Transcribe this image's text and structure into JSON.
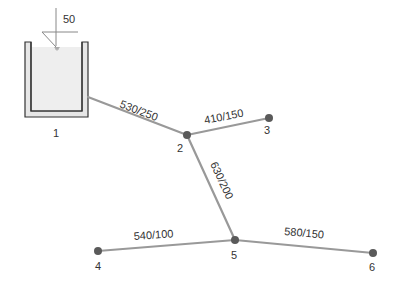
{
  "diagram": {
    "type": "pipe-network",
    "colors": {
      "pipe": "#999999",
      "node": "#5a5a5a",
      "tank_wall": "#333333",
      "tank_fill": "#e8e8e8",
      "tank_water": "#eeeeee",
      "text": "#333333"
    },
    "tank": {
      "id": "1",
      "label": "1",
      "head_value": "50"
    },
    "nodes": [
      {
        "id": "1",
        "label": "1",
        "x": 56,
        "y": 130
      },
      {
        "id": "2",
        "label": "2",
        "x": 187,
        "y": 135
      },
      {
        "id": "3",
        "label": "3",
        "x": 269,
        "y": 118
      },
      {
        "id": "4",
        "label": "4",
        "x": 98,
        "y": 251
      },
      {
        "id": "5",
        "label": "5",
        "x": 235,
        "y": 240
      },
      {
        "id": "6",
        "label": "6",
        "x": 373,
        "y": 253
      }
    ],
    "pipes": [
      {
        "from": "1",
        "to": "2",
        "label": "530/250"
      },
      {
        "from": "2",
        "to": "3",
        "label": "410/150"
      },
      {
        "from": "2",
        "to": "5",
        "label": "630/200"
      },
      {
        "from": "4",
        "to": "5",
        "label": "540/100"
      },
      {
        "from": "5",
        "to": "6",
        "label": "580/150"
      }
    ]
  }
}
